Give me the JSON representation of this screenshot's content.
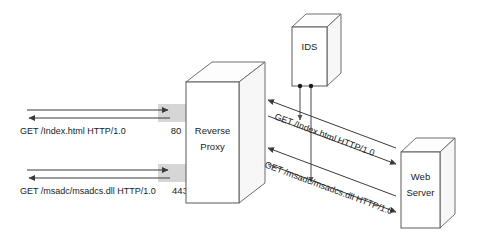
{
  "diagram": {
    "nodes": [
      {
        "id": "reverse-proxy",
        "label_line1": "Reverse",
        "label_line2": "Proxy"
      },
      {
        "id": "ids",
        "label_line1": "IDS",
        "label_line2": ""
      },
      {
        "id": "web-server",
        "label_line1": "Web",
        "label_line2": "Server"
      }
    ],
    "ports": [
      {
        "id": "port-80",
        "value": "80"
      },
      {
        "id": "port-443",
        "value": "443"
      }
    ],
    "client_requests": [
      {
        "id": "request-index",
        "text": "GET /Index.html HTTP/1.0"
      },
      {
        "id": "request-msadc",
        "text": "GET /msadc/msadcs.dll HTTP/1.0"
      }
    ],
    "backend_requests": [
      {
        "id": "backend-request-index",
        "text": "GET /Index.html HTTP/1.0"
      },
      {
        "id": "backend-request-msadc",
        "text": "GET /msadc/msadcs.dll HTTP/1.0"
      }
    ],
    "colors": {
      "band": "#d6d6d6",
      "stroke": "#5a5a5a",
      "arrow": "#3a3a3a",
      "text": "#1a1a1a",
      "background": "#ffffff"
    }
  }
}
